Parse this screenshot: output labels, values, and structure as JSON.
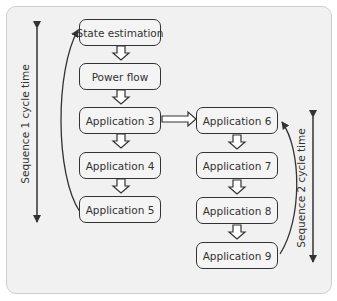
{
  "boxes": {
    "state_estimation": "State estimation",
    "power_flow": "Power flow",
    "app3": "Application 3",
    "app4": "Application 4",
    "app5": "Application 5",
    "app6": "Application 6",
    "app7": "Application 7",
    "app8": "Application 8",
    "app9": "Application 9"
  },
  "labels": {
    "sequence1": "Sequence 1 cycle time",
    "sequence2": "Sequence 2 cycle time"
  },
  "colors": {
    "stroke": "#333333",
    "box_fill": "#f4f4f4",
    "panel_fill": "#f1f1f1"
  }
}
